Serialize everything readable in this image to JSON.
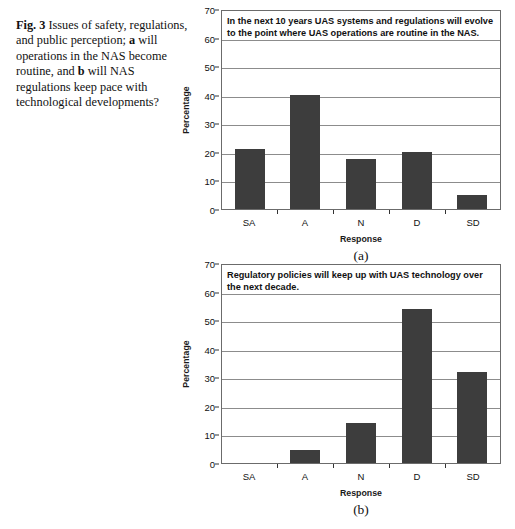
{
  "figure": {
    "label": "Fig. 3",
    "caption_parts": [
      {
        "text": "Fig. 3",
        "bold": true
      },
      {
        "text": "  Issues of safety, regulations, and public perception; ",
        "bold": false
      },
      {
        "text": "a",
        "bold": true
      },
      {
        "text": " will operations in the NAS become routine, and ",
        "bold": false
      },
      {
        "text": "b",
        "bold": true
      },
      {
        "text": " will NAS regulations keep pace with technological developments?",
        "bold": false
      }
    ],
    "caption_plain": "Fig. 3  Issues of safety, regulations, and public perception; a will operations in the NAS become routine, and b will NAS regulations keep pace with technological developments?"
  },
  "panels": [
    {
      "panel_label": "(a)",
      "title": "In the next 10 years UAS systems and regulations will evolve to the point where UAS operations are routine in the NAS.",
      "xlabel": "Response",
      "ylabel": "Percentage"
    },
    {
      "panel_label": "(b)",
      "title": "Regulatory policies will keep up with UAS technology over the next decade.",
      "xlabel": "Response",
      "ylabel": "Percentage"
    }
  ],
  "chart_data": [
    {
      "type": "bar",
      "id": "chart-a",
      "title": "In the next 10 years UAS systems and regulations will evolve to the point where UAS operations are routine in the NAS.",
      "panel_label": "(a)",
      "xlabel": "Response",
      "ylabel": "Percentage",
      "categories": [
        "SA",
        "A",
        "N",
        "D",
        "SD"
      ],
      "values": [
        21,
        40,
        17.5,
        20,
        5
      ],
      "ylim": [
        0,
        70
      ],
      "yticks": [
        0,
        10,
        20,
        30,
        40,
        50,
        60,
        70
      ],
      "ytick_labels": [
        "0",
        "10",
        "20",
        "30",
        "40",
        "50",
        "60",
        "70"
      ],
      "grid": true,
      "legend": false,
      "bar_color": "#3d3d3d"
    },
    {
      "type": "bar",
      "id": "chart-b",
      "title": "Regulatory policies will keep up with UAS technology over the next decade.",
      "panel_label": "(b)",
      "xlabel": "Response",
      "ylabel": "Percentage",
      "categories": [
        "SA",
        "A",
        "N",
        "D",
        "SD"
      ],
      "values": [
        0,
        4.5,
        14,
        54,
        32
      ],
      "ylim": [
        0,
        70
      ],
      "yticks": [
        0,
        10,
        20,
        30,
        40,
        50,
        60,
        70
      ],
      "ytick_labels": [
        "0",
        "10",
        "20",
        "30",
        "40",
        "50",
        "60",
        "70"
      ],
      "grid": true,
      "legend": false,
      "bar_color": "#3d3d3d"
    }
  ]
}
